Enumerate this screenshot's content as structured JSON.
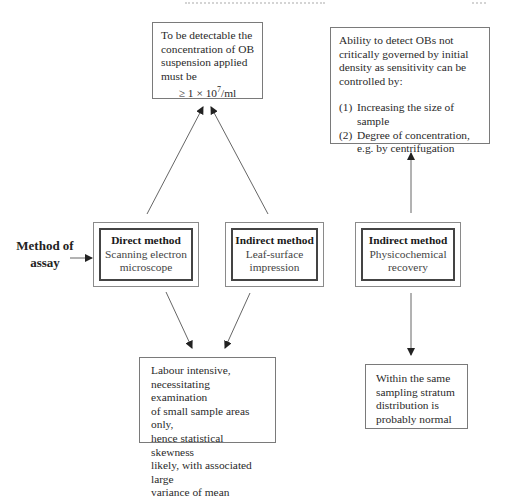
{
  "diagram": {
    "side_label": "Method of assay",
    "side_label_lines": [
      "Method of",
      "assay"
    ],
    "methods": [
      {
        "title": "Direct method",
        "sub_lines": [
          "Scanning electron",
          "microscope"
        ]
      },
      {
        "title": "Indirect method",
        "sub_lines": [
          "Leaf-surface",
          "impression"
        ]
      },
      {
        "title": "Indirect method",
        "sub_lines": [
          "Physicochemical",
          "recovery"
        ]
      }
    ],
    "notes": {
      "detection_threshold": {
        "lines": [
          "To be detectable the",
          "concentration of OB",
          "suspension applied",
          "must be"
        ],
        "formula_prefix": "≥ 1 × 10",
        "formula_exp": "7",
        "formula_suffix": "/ml"
      },
      "sensitivity": {
        "lines": [
          "Ability to detect OBs not",
          "critically governed by initial",
          "density as sensitivity can be",
          "controlled by:"
        ],
        "items": [
          {
            "num": "(1)",
            "text": "Increasing the size of sample"
          },
          {
            "num": "(2)",
            "text": "Degree of concentration, e.g. by centrifugation"
          }
        ]
      },
      "labour": {
        "lines": [
          "Labour intensive,",
          "necessitating examination",
          "of small sample areas only,",
          "hence statistical skewness",
          "likely, with associated large",
          "variance of mean"
        ]
      },
      "distribution": {
        "lines": [
          "Within the same",
          "sampling stratum",
          "distribution is",
          "probably normal"
        ]
      }
    },
    "colors": {
      "line": "#666666",
      "box_border": "#7a7a7a",
      "inner_border": "#444444"
    }
  }
}
